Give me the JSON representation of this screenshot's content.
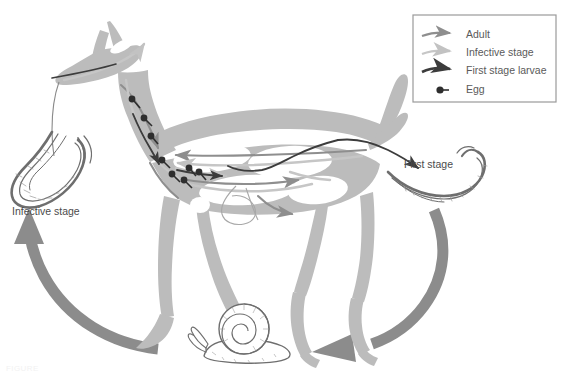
{
  "figure": {
    "caption": "FIGURE",
    "background_color": "#ffffff"
  },
  "colors": {
    "host_silhouette": "#bcbcbc",
    "cycle_arrow": "#8c8c8c",
    "adult_arrow": "#8e8e8e",
    "infective_arrow": "#c2c2c2",
    "first_stage_arrow": "#3c3c3c",
    "egg_dot": "#2e2e2e",
    "legend_border": "#9a9a9a",
    "text": "#4b4b4b",
    "drawing_ink": "#6e6e6e"
  },
  "legend": {
    "box_name": "legend-box",
    "items": [
      {
        "key": "adult",
        "label": "Adult",
        "style": "medium-gray-arrow"
      },
      {
        "key": "infective",
        "label": "Infective stage",
        "style": "light-gray-arrow"
      },
      {
        "key": "first_stage",
        "label": "First stage larvae",
        "style": "dark-thick-arrow"
      },
      {
        "key": "egg",
        "label": "Egg",
        "style": "dark-dot-with-stem"
      }
    ]
  },
  "labels": {
    "infective_stage": "Infective stage",
    "first_stage": "First stage"
  },
  "organisms": [
    {
      "key": "host",
      "name": "deer-silhouette",
      "role": "definitive host"
    },
    {
      "key": "snail",
      "name": "snail-illustration",
      "role": "intermediate host"
    },
    {
      "key": "l3",
      "name": "infective-larva-drawing",
      "role": "infective stage larva"
    },
    {
      "key": "l1",
      "name": "first-stage-larva-drawing",
      "role": "first stage larva"
    }
  ],
  "cycle_arrows": [
    {
      "key": "snail_to_host",
      "name": "cycle-arrow-snail-to-host",
      "direction": "up-left"
    },
    {
      "key": "host_to_snail",
      "name": "cycle-arrow-host-to-snail",
      "direction": "down-left"
    }
  ],
  "egg_count": 8
}
